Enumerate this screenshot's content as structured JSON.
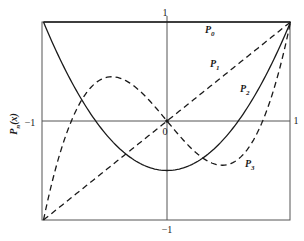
{
  "chart_data": {
    "type": "line",
    "title": "",
    "xlabel": "",
    "ylabel": "P_n(x)",
    "xlim": [
      -1,
      1
    ],
    "ylim": [
      -1,
      1
    ],
    "grid": false,
    "axis_ticks": {
      "top": "1",
      "bottom": "−1",
      "left": "−1",
      "right": "1",
      "origin": "0"
    },
    "series": [
      {
        "name": "P0",
        "label": "P",
        "sub": "0",
        "style": "solid",
        "formula": "1",
        "x": [
          -1,
          1
        ],
        "values": [
          1,
          1
        ]
      },
      {
        "name": "P1",
        "label": "P",
        "sub": "1",
        "style": "dashed",
        "formula": "x",
        "x": [
          -1,
          0,
          1
        ],
        "values": [
          -1,
          0,
          1
        ]
      },
      {
        "name": "P2",
        "label": "P",
        "sub": "2",
        "style": "solid",
        "formula": "(3x^2-1)/2",
        "x": [
          -1,
          -0.75,
          -0.5,
          -0.25,
          0,
          0.25,
          0.5,
          0.75,
          1
        ],
        "values": [
          1,
          0.344,
          -0.125,
          -0.406,
          -0.5,
          -0.406,
          -0.125,
          0.344,
          1
        ]
      },
      {
        "name": "P3",
        "label": "P",
        "sub": "3",
        "style": "dashed",
        "formula": "(5x^3-3x)/2",
        "x": [
          -1,
          -0.75,
          -0.5,
          -0.25,
          0,
          0.25,
          0.5,
          0.75,
          1
        ],
        "values": [
          -1,
          0.07,
          0.438,
          0.336,
          0,
          -0.336,
          -0.438,
          -0.07,
          1
        ]
      }
    ],
    "legend_positions": {
      "P0": [
        205,
        33
      ],
      "P1": [
        210,
        67
      ],
      "P2": [
        240,
        92
      ],
      "P3": [
        245,
        167
      ]
    },
    "layout": {
      "plot_left": 42,
      "plot_right": 290,
      "plot_top": 22,
      "plot_bottom": 220,
      "origin_x": 167,
      "origin_y": 121,
      "x_scale": 123.5,
      "y_scale": 99
    }
  }
}
